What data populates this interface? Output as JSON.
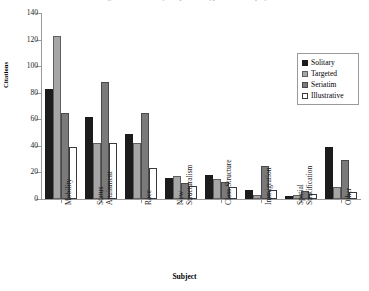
{
  "chart_data": {
    "type": "bar",
    "title": "Figure 1. Citations by Subject and Type of Data Display",
    "xlabel": "Subject",
    "ylabel": "Citations",
    "ylim": [
      0,
      140
    ],
    "ytick_values": [
      0,
      20,
      40,
      60,
      80,
      100,
      120,
      140
    ],
    "ytick_labels": [
      "0",
      "20",
      "40",
      "60",
      "80",
      "100",
      "120",
      "140"
    ],
    "grid": false,
    "legend_position": "top-right",
    "categories": [
      "Mobility",
      "Status\nAttainment",
      "Race",
      "New\nStructuralism",
      "Class Structure",
      "Immigration",
      "Spatial\nStratification",
      "Other"
    ],
    "series": [
      {
        "name": "Solitary",
        "color": "#1c1c1c",
        "values": [
          83,
          62,
          49,
          16,
          18,
          7,
          2,
          39
        ]
      },
      {
        "name": "Targeted",
        "color": "#a6a6a6",
        "values": [
          123,
          42,
          42,
          17,
          15,
          3,
          3,
          9
        ]
      },
      {
        "name": "Seriatim",
        "color": "#7a7a7a",
        "values": [
          65,
          88,
          65,
          12,
          13,
          25,
          6,
          29
        ]
      },
      {
        "name": "Illustrative",
        "color": "#ffffff",
        "values": [
          39,
          42,
          23,
          10,
          9,
          7,
          4,
          5
        ]
      }
    ]
  }
}
